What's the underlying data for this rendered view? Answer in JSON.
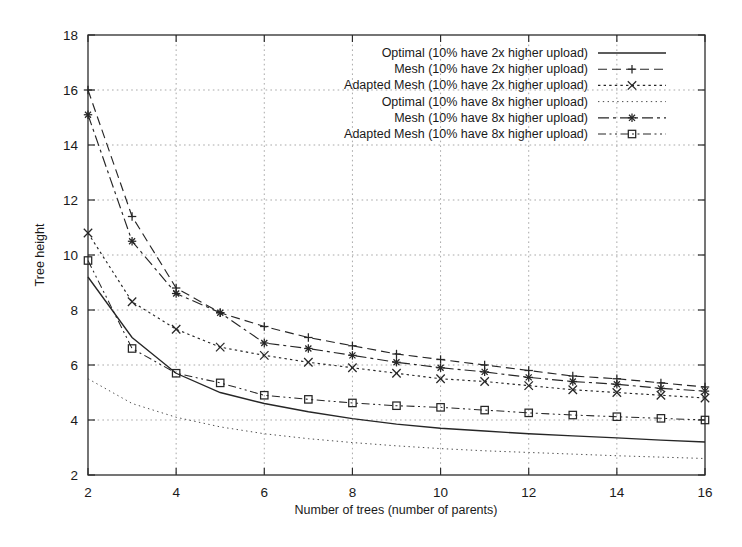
{
  "chart_data": {
    "type": "line",
    "title": "",
    "xlabel": "Number of trees (number of parents)",
    "ylabel": "Tree height",
    "xlim": [
      2,
      16
    ],
    "ylim": [
      2,
      18
    ],
    "xticks": [
      2,
      4,
      6,
      8,
      10,
      12,
      14,
      16
    ],
    "yticks": [
      2,
      4,
      6,
      8,
      10,
      12,
      14,
      16,
      18
    ],
    "grid": true,
    "legend_position": "top-right",
    "x": [
      2,
      3,
      4,
      5,
      6,
      7,
      8,
      9,
      10,
      11,
      12,
      13,
      14,
      15,
      16
    ],
    "series": [
      {
        "name": "Optimal (10% have 2x higher upload)",
        "style": "solid",
        "marker": "none",
        "color": "#262626",
        "values": [
          9.2,
          7.0,
          5.7,
          5.0,
          4.6,
          4.3,
          4.05,
          3.85,
          3.7,
          3.6,
          3.5,
          3.42,
          3.35,
          3.27,
          3.2
        ]
      },
      {
        "name": "Mesh (10% have 2x higher upload)",
        "style": "dashed",
        "marker": "plus",
        "color": "#262626",
        "values": [
          16.0,
          11.4,
          8.8,
          7.9,
          7.4,
          7.0,
          6.7,
          6.4,
          6.2,
          6.0,
          5.8,
          5.6,
          5.5,
          5.35,
          5.2
        ]
      },
      {
        "name": "Adapted Mesh (10% have 2x higher upload)",
        "style": "dotted",
        "marker": "cross",
        "color": "#262626",
        "values": [
          10.8,
          8.3,
          7.3,
          6.65,
          6.35,
          6.1,
          5.9,
          5.7,
          5.5,
          5.4,
          5.25,
          5.1,
          5.0,
          4.9,
          4.8
        ]
      },
      {
        "name": "Optimal (10% have 8x higher upload)",
        "style": "fine-dotted",
        "marker": "none",
        "color": "#4d4d4d",
        "values": [
          5.5,
          4.6,
          4.1,
          3.75,
          3.5,
          3.32,
          3.18,
          3.06,
          2.96,
          2.88,
          2.82,
          2.76,
          2.7,
          2.65,
          2.6
        ]
      },
      {
        "name": "Mesh (10% have 8x higher upload)",
        "style": "dashdot",
        "marker": "star",
        "color": "#262626",
        "values": [
          15.1,
          10.5,
          8.6,
          7.9,
          6.8,
          6.6,
          6.35,
          6.1,
          5.9,
          5.75,
          5.55,
          5.4,
          5.3,
          5.15,
          5.05
        ]
      },
      {
        "name": "Adapted Mesh (10% have 8x higher upload)",
        "style": "dashdotdot",
        "marker": "square",
        "color": "#262626",
        "values": [
          9.8,
          6.6,
          5.7,
          5.35,
          4.9,
          4.75,
          4.62,
          4.52,
          4.46,
          4.36,
          4.26,
          4.18,
          4.12,
          4.06,
          4.0
        ]
      }
    ]
  },
  "axes": {
    "y_label": "Tree height",
    "x_label": "Number of trees (number of parents)",
    "y_tick_labels": [
      "2",
      "4",
      "6",
      "8",
      "10",
      "12",
      "14",
      "16",
      "18"
    ],
    "x_tick_labels": [
      "2",
      "4",
      "6",
      "8",
      "10",
      "12",
      "14",
      "16"
    ]
  },
  "legend": {
    "entries": [
      "Optimal (10% have 2x higher upload)",
      "Mesh (10% have 2x higher upload)",
      "Adapted Mesh (10% have 2x higher upload)",
      "Optimal (10% have 8x higher upload)",
      "Mesh (10% have 8x higher upload)",
      "Adapted Mesh (10% have 8x higher upload)"
    ]
  }
}
